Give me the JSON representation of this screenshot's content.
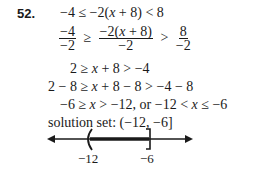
{
  "problem": {
    "number": "52.",
    "steps": [
      "−4 ≤ −2(x + 8) < 8",
      "fraction-step",
      "2 ≥ x + 8 > −4",
      "2 − 8 ≥ x + 8 − 8 > −4 − 8",
      "−6 ≥ x > −12, or −12 < x ≤ −6"
    ],
    "fraction_step": {
      "left_num": "−4",
      "left_den": "−2",
      "rel1": "≥",
      "mid_num": "−2(x + 8)",
      "mid_den": "−2",
      "rel2": ">",
      "right_num": "8",
      "right_den": "−2"
    },
    "solution_label": "solution set: (−12, −6]",
    "number_line": {
      "left_endpoint": "−12",
      "left_bracket": "(",
      "right_endpoint": "−6",
      "right_bracket": "]",
      "interval": "(−12, −6]"
    }
  }
}
